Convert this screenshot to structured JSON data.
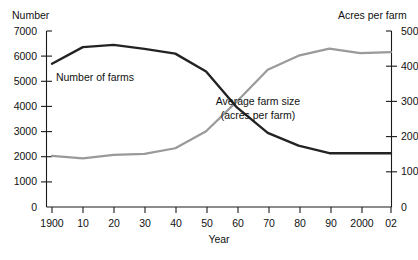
{
  "chart_data": {
    "type": "line",
    "title": "",
    "xlabel": "Year",
    "ylabel": "Number",
    "y2label": "Acres per farm",
    "grid": false,
    "legend_position": "inline-annotations",
    "categories": [
      "1900",
      "10",
      "20",
      "30",
      "40",
      "50",
      "60",
      "70",
      "80",
      "90",
      "2000",
      "02"
    ],
    "x_tick_labels": [
      "1900",
      "10",
      "20",
      "30",
      "40",
      "50",
      "60",
      "70",
      "80",
      "90",
      "2000",
      "02"
    ],
    "y_tick_labels": [
      "0",
      "1000",
      "2000",
      "3000",
      "4000",
      "5000",
      "6000",
      "7000"
    ],
    "y2_tick_labels": [
      "0",
      "100",
      "200",
      "300",
      "400",
      "500"
    ],
    "ylim": [
      0,
      7000
    ],
    "y2lim": [
      0,
      500
    ],
    "series": [
      {
        "name": "Number of farms",
        "axis": "left",
        "color": "#232323",
        "units": "thousands of farms",
        "values": [
          5700,
          6360,
          6450,
          6290,
          6100,
          5390,
          3960,
          2950,
          2440,
          2140,
          2140,
          2140
        ]
      },
      {
        "name": "Average farm size (acres per farm)",
        "axis": "right",
        "color": "#9a9a9a",
        "units": "acres per farm",
        "values": [
          145,
          138,
          148,
          151,
          167,
          215,
          300,
          390,
          430,
          450,
          437,
          440
        ]
      }
    ],
    "annotations": [
      {
        "text": "Number of farms",
        "x": 95,
        "y": 78
      },
      {
        "text": "Average farm size",
        "x": 255,
        "y": 102
      },
      {
        "text": "(acres per farm)",
        "x": 255,
        "y": 116
      }
    ]
  },
  "labels": {
    "left_axis_title": "Number",
    "right_axis_title": "Acres per farm",
    "x_axis_title": "Year",
    "series_dark_label": "Number of farms",
    "series_gray_label_line1": "Average farm size",
    "series_gray_label_line2": "(acres per farm)"
  },
  "y_ticks": [
    {
      "label": "7000",
      "value": 7000
    },
    {
      "label": "6000",
      "value": 6000
    },
    {
      "label": "5000",
      "value": 5000
    },
    {
      "label": "4000",
      "value": 4000
    },
    {
      "label": "3000",
      "value": 3000
    },
    {
      "label": "2000",
      "value": 2000
    },
    {
      "label": "1000",
      "value": 1000
    },
    {
      "label": "0",
      "value": 0
    }
  ],
  "y2_ticks": [
    {
      "label": "500",
      "value": 500
    },
    {
      "label": "400",
      "value": 400
    },
    {
      "label": "300",
      "value": 300
    },
    {
      "label": "200",
      "value": 200
    },
    {
      "label": "100",
      "value": 100
    },
    {
      "label": "0",
      "value": 0
    }
  ],
  "x_ticks": [
    {
      "label": "1900"
    },
    {
      "label": "10"
    },
    {
      "label": "20"
    },
    {
      "label": "30"
    },
    {
      "label": "40"
    },
    {
      "label": "50"
    },
    {
      "label": "60"
    },
    {
      "label": "70"
    },
    {
      "label": "80"
    },
    {
      "label": "90"
    },
    {
      "label": "2000"
    },
    {
      "label": "02"
    }
  ]
}
